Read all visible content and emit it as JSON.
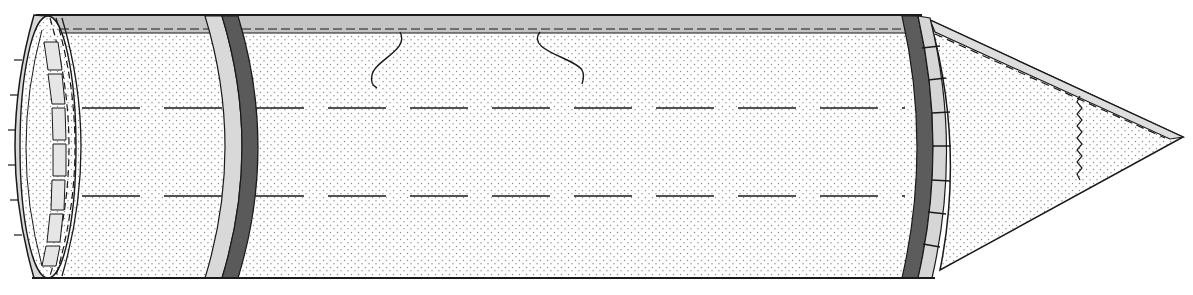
{
  "figure": {
    "type": "technical-line-drawing",
    "caption": "",
    "colors": {
      "background": "#ffffff",
      "outline": "#1a1a1a",
      "stipple": "#8a8a8a",
      "light_band": "#d6d6d6",
      "dark_band": "#5a5a5a",
      "top_strip": "#bdbdbd"
    },
    "geometry": {
      "body_left_x": 48,
      "body_right_x": 920,
      "top_y": 16,
      "bottom_y": 278,
      "tip_x": 1183,
      "tip_y": 137,
      "dashed_line_ys": [
        108,
        196
      ],
      "left_band_x": 215,
      "right_collar_x": 918
    }
  }
}
